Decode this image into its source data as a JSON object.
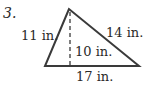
{
  "problem": {
    "number": "3.",
    "figure": "triangle",
    "labels": {
      "left_side": "11 in.",
      "right_side": "14 in.",
      "height": "10 in.",
      "base": "17 in."
    },
    "colors": {
      "stroke": "#3a3a3a",
      "text": "#2a2a2a"
    }
  }
}
